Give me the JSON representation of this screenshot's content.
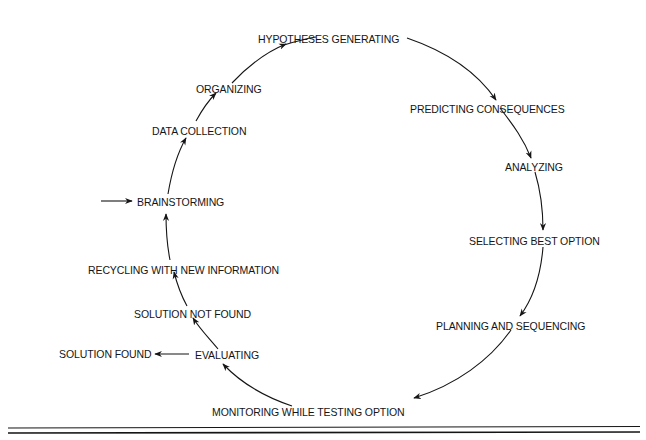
{
  "diagram": {
    "type": "cycle",
    "direction": "clockwise",
    "entry_point": "BRAINSTORMING",
    "exit": {
      "from": "EVALUATING",
      "to": "SOLUTION FOUND"
    },
    "nodes": [
      {
        "id": "brainstorming",
        "label": "BRAINSTORMING"
      },
      {
        "id": "data-collection",
        "label": "DATA COLLECTION"
      },
      {
        "id": "organizing",
        "label": "ORGANIZING"
      },
      {
        "id": "hypotheses-generating",
        "label": "HYPOTHESES GENERATING"
      },
      {
        "id": "predicting-consequences",
        "label": "PREDICTING CONSEQUENCES"
      },
      {
        "id": "analyzing",
        "label": "ANALYZING"
      },
      {
        "id": "selecting-best-option",
        "label": "SELECTING BEST OPTION"
      },
      {
        "id": "planning-and-sequencing",
        "label": "PLANNING AND SEQUENCING"
      },
      {
        "id": "monitoring-while-testing-option",
        "label": "MONITORING WHILE TESTING OPTION"
      },
      {
        "id": "evaluating",
        "label": "EVALUATING"
      },
      {
        "id": "solution-not-found",
        "label": "SOLUTION NOT FOUND"
      },
      {
        "id": "recycling-with-new-information",
        "label": "RECYCLING WITH NEW INFORMATION"
      }
    ],
    "outcome": {
      "id": "solution-found",
      "label": "SOLUTION FOUND"
    },
    "edges": [
      [
        "start",
        "brainstorming"
      ],
      [
        "brainstorming",
        "data-collection"
      ],
      [
        "data-collection",
        "organizing"
      ],
      [
        "organizing",
        "hypotheses-generating"
      ],
      [
        "hypotheses-generating",
        "predicting-consequences"
      ],
      [
        "predicting-consequences",
        "analyzing"
      ],
      [
        "analyzing",
        "selecting-best-option"
      ],
      [
        "selecting-best-option",
        "planning-and-sequencing"
      ],
      [
        "planning-and-sequencing",
        "monitoring-while-testing-option"
      ],
      [
        "monitoring-while-testing-option",
        "evaluating"
      ],
      [
        "evaluating",
        "solution-found"
      ],
      [
        "evaluating",
        "solution-not-found"
      ],
      [
        "solution-not-found",
        "recycling-with-new-information"
      ],
      [
        "recycling-with-new-information",
        "brainstorming"
      ]
    ]
  },
  "colors": {
    "ink": "#151515",
    "background": "#ffffff"
  }
}
